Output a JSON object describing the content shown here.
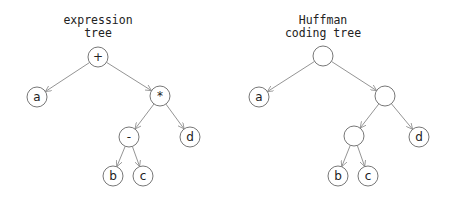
{
  "trees": [
    {
      "title_lines": [
        "expression",
        "tree"
      ],
      "title_x": 98,
      "nodes": [
        {
          "id": "root",
          "label": "+",
          "x": 98,
          "y": 57
        },
        {
          "id": "a",
          "label": "a",
          "x": 37,
          "y": 97
        },
        {
          "id": "mul",
          "label": "*",
          "x": 160,
          "y": 96
        },
        {
          "id": "minus",
          "label": "-",
          "x": 129,
          "y": 137
        },
        {
          "id": "d",
          "label": "d",
          "x": 190,
          "y": 137
        },
        {
          "id": "b",
          "label": "b",
          "x": 113,
          "y": 176
        },
        {
          "id": "c",
          "label": "c",
          "x": 143,
          "y": 176
        }
      ],
      "edges": [
        [
          "root",
          "a"
        ],
        [
          "root",
          "mul"
        ],
        [
          "mul",
          "minus"
        ],
        [
          "mul",
          "d"
        ],
        [
          "minus",
          "b"
        ],
        [
          "minus",
          "c"
        ]
      ]
    },
    {
      "title_lines": [
        "Huffman",
        "coding tree"
      ],
      "title_x": 323,
      "nodes": [
        {
          "id": "root",
          "label": "",
          "x": 323,
          "y": 56
        },
        {
          "id": "a",
          "label": "a",
          "x": 259,
          "y": 97
        },
        {
          "id": "n1",
          "label": "",
          "x": 385,
          "y": 96
        },
        {
          "id": "n2",
          "label": "",
          "x": 354,
          "y": 136
        },
        {
          "id": "d",
          "label": "d",
          "x": 419,
          "y": 137
        },
        {
          "id": "b",
          "label": "b",
          "x": 338,
          "y": 176
        },
        {
          "id": "c",
          "label": "c",
          "x": 368,
          "y": 176
        }
      ],
      "edges": [
        [
          "root",
          "a"
        ],
        [
          "root",
          "n1"
        ],
        [
          "n1",
          "n2"
        ],
        [
          "n1",
          "d"
        ],
        [
          "n2",
          "b"
        ],
        [
          "n2",
          "c"
        ]
      ]
    }
  ],
  "node_radius": 10
}
